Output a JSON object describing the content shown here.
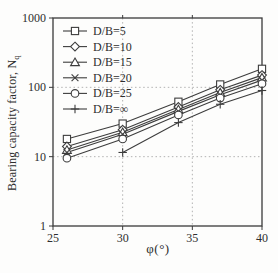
{
  "figure": {
    "background": "#fdfdfc",
    "line_color": "#3d3d3d",
    "marker_fill": "#ffffff",
    "grid_color": "#b2b2b2",
    "frame_color": "#3a3a3a",
    "text_color": "#2e2e2e"
  },
  "axes": {
    "x_label": "φ(°)",
    "y_label_main": "Bearing capacity factor, N",
    "y_label_sub": "q",
    "x_ticks": [
      "25",
      "30",
      "35",
      "40"
    ],
    "y_ticks": [
      "1",
      "10",
      "100",
      "1000"
    ]
  },
  "chart_data": {
    "type": "line",
    "title": "",
    "xlabel": "φ(°)",
    "ylabel": "Bearing capacity factor, N_q",
    "x_range": [
      25,
      40
    ],
    "y_scale": "log",
    "y_range": [
      1,
      1000
    ],
    "x_gridlines": [
      30,
      35
    ],
    "y_gridlines": [
      10,
      100
    ],
    "grid_style": "dotted",
    "legend_position": "top-left-inside",
    "series": [
      {
        "name": "D/B=5",
        "marker": "square",
        "x": [
          26,
          30,
          34,
          37,
          40
        ],
        "values": [
          18,
          30,
          62,
          110,
          185
        ]
      },
      {
        "name": "D/B=10",
        "marker": "diamond",
        "x": [
          26,
          30,
          34,
          37,
          40
        ],
        "values": [
          14,
          24.5,
          52,
          92,
          150
        ]
      },
      {
        "name": "D/B=15",
        "marker": "triangle",
        "x": [
          26,
          30,
          34,
          37,
          40
        ],
        "values": [
          12.5,
          22.5,
          48,
          84,
          138
        ]
      },
      {
        "name": "D/B=20",
        "marker": "x",
        "x": [
          26,
          30,
          34,
          37,
          40
        ],
        "values": [
          11.5,
          21,
          45,
          78,
          127
        ]
      },
      {
        "name": "D/B=25",
        "marker": "circle",
        "x": [
          26,
          30,
          34,
          37,
          40
        ],
        "values": [
          9.5,
          18,
          40,
          70,
          113
        ]
      },
      {
        "name": "D/B=∞",
        "marker": "plus",
        "x": [
          30,
          34,
          37,
          40
        ],
        "values": [
          11.5,
          31,
          57,
          90
        ]
      }
    ]
  }
}
